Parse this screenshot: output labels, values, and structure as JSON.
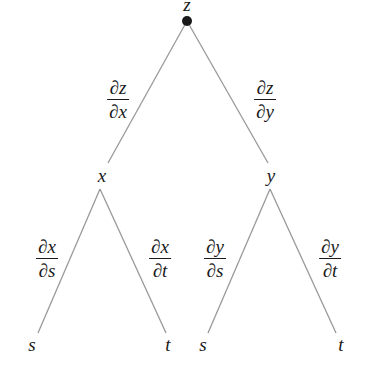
{
  "diagram": {
    "type": "tree",
    "colors": {
      "line": "#999999",
      "text": "#1a1a1a",
      "root_dot": "#1a1a1a",
      "background": "#ffffff"
    },
    "nodes": {
      "root": {
        "label": "z"
      },
      "mid_left": {
        "label": "x"
      },
      "mid_right": {
        "label": "y"
      },
      "leaf_1": {
        "label": "s"
      },
      "leaf_2": {
        "label": "t"
      },
      "leaf_3": {
        "label": "s"
      },
      "leaf_4": {
        "label": "t"
      }
    },
    "edges": {
      "z_x": {
        "partial": "∂",
        "num_var": "z",
        "den_var": "x"
      },
      "z_y": {
        "partial": "∂",
        "num_var": "z",
        "den_var": "y"
      },
      "x_s": {
        "partial": "∂",
        "num_var": "x",
        "den_var": "s"
      },
      "x_t": {
        "partial": "∂",
        "num_var": "x",
        "den_var": "t"
      },
      "y_s": {
        "partial": "∂",
        "num_var": "y",
        "den_var": "s"
      },
      "y_t": {
        "partial": "∂",
        "num_var": "y",
        "den_var": "t"
      }
    }
  }
}
